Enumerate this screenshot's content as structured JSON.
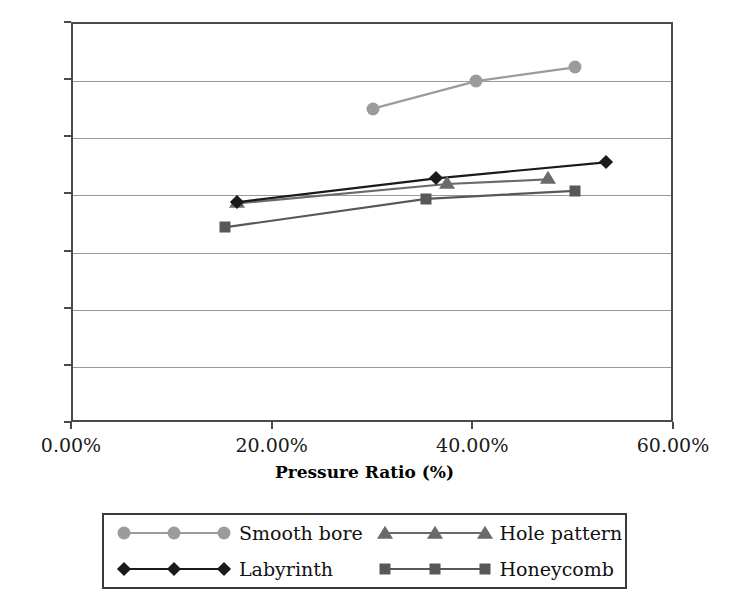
{
  "chart_data": {
    "type": "line",
    "title": "",
    "xlabel": "Pressure Ratio (%)",
    "ylabel": "",
    "xlim": [
      0,
      60
    ],
    "ylim": [
      0,
      0.35
    ],
    "grid": true,
    "legend_position": "bottom",
    "xticks": [
      "0.00%",
      "20.00%",
      "40.00%",
      "60.00%"
    ],
    "xtick_values": [
      0,
      20,
      40,
      60
    ],
    "yticks": [
      "0",
      "0.05",
      "0.1",
      "0.15",
      "0.2",
      "0.25",
      "0.3",
      "0.35"
    ],
    "ytick_values": [
      0,
      0.05,
      0.1,
      0.15,
      0.2,
      0.25,
      0.3,
      0.35
    ],
    "series": [
      {
        "name": "Smooth bore",
        "marker": "circle",
        "color": "#9b9b9b",
        "x": [
          29.9,
          40.2,
          50.0
        ],
        "y": [
          0.276,
          0.3,
          0.312
        ]
      },
      {
        "name": "Hole pattern",
        "marker": "triangle",
        "color": "#6a6a6a",
        "x": [
          16.3,
          37.3,
          47.3
        ],
        "y": [
          0.193,
          0.21,
          0.214
        ]
      },
      {
        "name": "Labyrinth",
        "marker": "diamond",
        "color": "#1a1a1a",
        "x": [
          16.3,
          36.2,
          53.1
        ],
        "y": [
          0.194,
          0.215,
          0.229
        ]
      },
      {
        "name": "Honeycomb",
        "marker": "square",
        "color": "#585858",
        "x": [
          15.1,
          35.2,
          50.0
        ],
        "y": [
          0.172,
          0.197,
          0.204
        ]
      }
    ]
  },
  "legend": {
    "entries": [
      {
        "label": "Smooth bore"
      },
      {
        "label": "Hole pattern"
      },
      {
        "label": "Labyrinth"
      },
      {
        "label": "Honeycomb"
      }
    ]
  },
  "axis": {
    "x_title": "Pressure Ratio (%)"
  },
  "colors": {
    "frame": "#4a4a4a",
    "grid": "#9a9a9a",
    "smooth_bore": "#9b9b9b",
    "hole_pattern": "#6a6a6a",
    "labyrinth": "#1a1a1a",
    "honeycomb": "#585858"
  }
}
